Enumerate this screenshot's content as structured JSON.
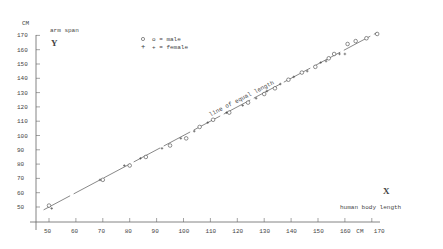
{
  "chart_data": {
    "type": "scatter",
    "title": "",
    "xlabel": "human body length",
    "ylabel": "arm span",
    "x_unit": "CM",
    "y_unit": "CM",
    "x_axis_letter": "X",
    "y_axis_letter": "Y",
    "xlim": [
      45,
      175
    ],
    "ylim": [
      40,
      180
    ],
    "x_ticks": [
      50,
      60,
      70,
      80,
      90,
      100,
      110,
      120,
      130,
      140,
      150,
      160,
      170
    ],
    "y_ticks": [
      50,
      60,
      70,
      80,
      90,
      100,
      110,
      120,
      130,
      140,
      150,
      160,
      170
    ],
    "grid": false,
    "legend": {
      "position": "top-left",
      "entries": [
        {
          "marker": "o",
          "label": "o = male"
        },
        {
          "marker": "+",
          "label": "+ = female"
        }
      ]
    },
    "reference_line": {
      "label": "line of equal length",
      "from": [
        48,
        48
      ],
      "to": [
        172,
        172
      ]
    },
    "series": [
      {
        "name": "male",
        "marker": "o",
        "x": [
          50,
          70,
          80,
          86,
          95,
          101,
          106,
          111,
          117,
          124,
          130,
          134,
          139,
          144,
          149,
          154,
          156,
          161,
          164,
          168,
          172
        ],
        "y": [
          51,
          69,
          79,
          85,
          93,
          98,
          106,
          111,
          116,
          123,
          129,
          133,
          139,
          144,
          148,
          154,
          157,
          164,
          166,
          168,
          171
        ]
      },
      {
        "name": "female",
        "marker": "+",
        "x": [
          51,
          69,
          78,
          84,
          92,
          99,
          104,
          109,
          116,
          122,
          127,
          131,
          136,
          141,
          146,
          151,
          153,
          158,
          160
        ],
        "y": [
          49,
          69,
          79,
          84,
          91,
          98,
          103,
          109,
          116,
          121,
          126,
          131,
          136,
          141,
          145,
          151,
          152,
          157,
          157
        ]
      }
    ]
  },
  "labels": {
    "y_unit": "CM",
    "y_title": "arm span",
    "y_letter": "Y",
    "x_title": "human body length",
    "x_letter": "X",
    "x_unit": "CM",
    "legend_male": "o = male",
    "legend_female": "+ = female",
    "line_label": "line of equal length"
  }
}
